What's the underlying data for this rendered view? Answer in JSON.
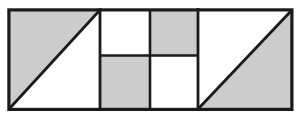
{
  "figure": {
    "title": "Rectangle divided into shaded and unshaded regions",
    "canvas": {
      "width": 300,
      "height": 124,
      "background": "#ffffff"
    },
    "colors": {
      "shaded": "#cccccc",
      "unshaded": "#ffffff",
      "stroke": "#1a1a1a",
      "background": "#ffffff"
    },
    "stroke": {
      "outer_width": 3.2,
      "inner_width": 2.6,
      "diagonal_width": 2.8
    },
    "frame": {
      "x": 8.5,
      "y": 9.5,
      "width": 283,
      "height": 99.5
    },
    "sections": [
      {
        "name": "left-square",
        "type": "diagonal-split-square",
        "x": 10,
        "y": 11,
        "width": 89,
        "height": 97,
        "diagonal": "bottom-left-to-top-right",
        "shaded_half": "upper-left",
        "shaded_label": "upper-left triangle shaded",
        "unshaded_label": "lower-right triangle unshaded"
      },
      {
        "name": "middle-checkerboard",
        "type": "two-by-two-grid",
        "x": 101,
        "y": 11,
        "width": 96,
        "height": 97,
        "columns": 2,
        "rows": 2,
        "split_x": 150,
        "split_y": 55.5,
        "cells": [
          {
            "name": "middle-cell-top-left",
            "row": 0,
            "col": 0,
            "fill": "unshaded"
          },
          {
            "name": "middle-cell-top-right",
            "row": 0,
            "col": 1,
            "fill": "shaded"
          },
          {
            "name": "middle-cell-bottom-left",
            "row": 1,
            "col": 0,
            "fill": "shaded"
          },
          {
            "name": "middle-cell-bottom-right",
            "row": 1,
            "col": 1,
            "fill": "unshaded"
          }
        ]
      },
      {
        "name": "right-square",
        "type": "diagonal-split-square",
        "x": 199,
        "y": 11,
        "width": 92,
        "height": 97,
        "diagonal": "bottom-left-to-top-right",
        "shaded_half": "lower-right",
        "shaded_label": "lower-right triangle shaded",
        "unshaded_label": "upper-left triangle unshaded"
      }
    ]
  }
}
